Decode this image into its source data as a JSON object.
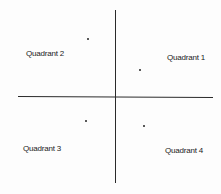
{
  "diagram": {
    "type": "cartesian-quadrants",
    "labels": {
      "q1": "Quadrant 1",
      "q2": "Quadrant 2",
      "q3": "Quadrant 3",
      "q4": "Quadrant 4"
    },
    "points": [
      {
        "quadrant": 2,
        "x": 87,
        "y": 38
      },
      {
        "quadrant": 1,
        "x": 140,
        "y": 70
      },
      {
        "quadrant": 3,
        "x": 86,
        "y": 121
      },
      {
        "quadrant": 4,
        "x": 144,
        "y": 126
      }
    ],
    "colors": {
      "line": "#2a2a2a",
      "text": "#222222",
      "background": "#ffffff"
    }
  }
}
